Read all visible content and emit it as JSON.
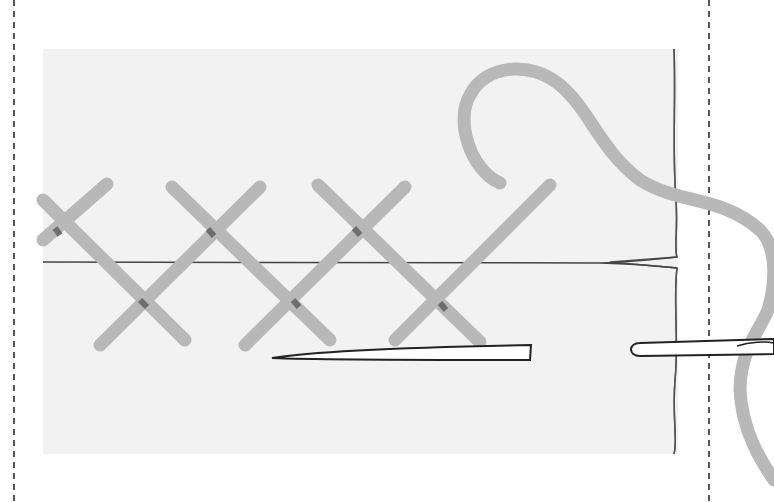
{
  "diagram": {
    "caption": "",
    "colors": {
      "background": "#ffffff",
      "fabric": "#f2f2f2",
      "fabric_edge": "#555555",
      "thread": "#b8b8b8",
      "thread_shadow": "#6e6e6e",
      "needle_fill": "#ffffff",
      "needle_outline": "#222222",
      "guide_line": "#555555"
    },
    "elements": {
      "guide_lines": [
        {
          "x": 14
        },
        {
          "x": 709
        }
      ],
      "fabric": {
        "x": 43,
        "y": 49,
        "width": 640,
        "height": 405
      },
      "fold_line_y": 263,
      "stitches": [
        {
          "top_left": [
            43,
            218
          ],
          "crosses_at": [
            60,
            230
          ]
        },
        {
          "top_left": [
            172,
            185
          ],
          "crosses_at": [
            215,
            227
          ]
        },
        {
          "top_left": [
            320,
            185
          ],
          "crosses_at": [
            357,
            227
          ]
        },
        {
          "top_left": null,
          "crosses_at": [
            440,
            270
          ]
        }
      ],
      "needles": [
        {
          "name": "needle-left",
          "tip": [
            272,
            358
          ],
          "end": [
            530,
            352
          ]
        },
        {
          "name": "needle-right",
          "eye": [
            633,
            349
          ],
          "end": [
            774,
            345
          ]
        }
      ]
    }
  }
}
